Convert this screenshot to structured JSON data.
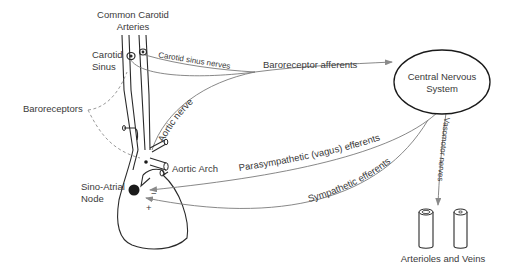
{
  "labels": {
    "common_carotid_line1": "Common Carotid",
    "common_carotid_line2": "Arteries",
    "carotid_sinus_line1": "Carotid",
    "carotid_sinus_line2": "Sinus",
    "carotid_sinus_nerves": "Carotid sinus nerves",
    "baroreceptor_afferents": "Baroreceptor afferents",
    "aortic_nerve": "Aortic nerve",
    "baroreceptors": "Baroreceptors",
    "aortic_arch": "Aortic Arch",
    "sa_node_line1": "Sino-Atrial",
    "sa_node_line2": "Node",
    "parasympathetic": "Parasympathetic (vagus) efferents",
    "sympathetic": "Sympathetic efferents",
    "vasomotor": "Vasomotor nerves",
    "cns_line1": "Central Nervous",
    "cns_line2": "System",
    "arterioles_veins": "Arterioles and Veins",
    "minus": "−",
    "plus": "+"
  },
  "colors": {
    "line": "#2a2a2a",
    "pathway": "#7a7a7a",
    "text": "#3a3a3a",
    "node_fill": "#1a1a1a"
  }
}
